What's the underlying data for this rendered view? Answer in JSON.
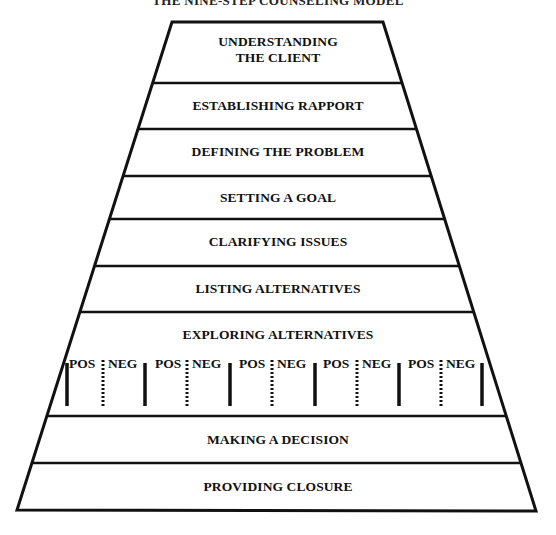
{
  "diagram": {
    "title": "THE NINE-STEP COUNSELING MODEL",
    "type": "inverted-funnel / trapezoid stack",
    "steps": [
      {
        "label_line1": "UNDERSTANDING",
        "label_line2": "THE CLIENT"
      },
      {
        "label": "ESTABLISHING RAPPORT"
      },
      {
        "label": "DEFINING THE PROBLEM"
      },
      {
        "label": "SETTING A GOAL"
      },
      {
        "label": "CLARIFYING ISSUES"
      },
      {
        "label": "LISTING ALTERNATIVES"
      },
      {
        "label": "EXPLORING ALTERNATIVES",
        "sub_columns": [
          {
            "pos": "POS",
            "neg": "NEG"
          },
          {
            "pos": "POS",
            "neg": "NEG"
          },
          {
            "pos": "POS",
            "neg": "NEG"
          },
          {
            "pos": "POS",
            "neg": "NEG"
          },
          {
            "pos": "POS",
            "neg": "NEG"
          }
        ]
      },
      {
        "label": "MAKING A DECISION"
      },
      {
        "label": "PROVIDING CLOSURE"
      }
    ],
    "colors": {
      "line": "#111111",
      "background": "#ffffff",
      "text": "#111111"
    }
  }
}
